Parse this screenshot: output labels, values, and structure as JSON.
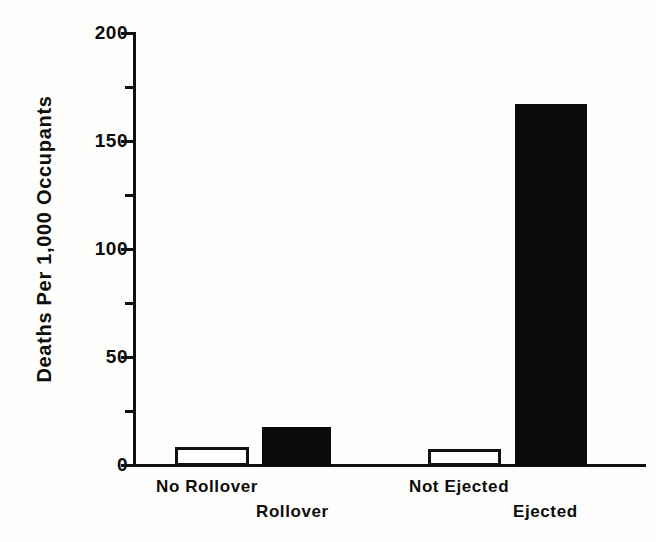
{
  "chart_data": {
    "type": "bar",
    "title": "",
    "xlabel": "",
    "ylabel": "Deaths Per 1,000 Occupants",
    "ylim": [
      0,
      200
    ],
    "grid": false,
    "legend": "none",
    "y_ticks_major": [
      "0",
      "50",
      "100",
      "150",
      "200"
    ],
    "y_tick_values_major": [
      0,
      50,
      100,
      150,
      200
    ],
    "y_tick_values_minor": [
      25,
      75,
      125,
      175
    ],
    "categories": [
      "No Rollover",
      "Rollover",
      "Not Ejected",
      "Ejected"
    ],
    "values": [
      9,
      18,
      8,
      167
    ],
    "bar_styles": [
      "open",
      "filled",
      "open",
      "filled"
    ],
    "groups": [
      {
        "name": "Rollover status",
        "bars": [
          {
            "label": "No Rollover",
            "value": 9,
            "style": "open"
          },
          {
            "label": "Rollover",
            "value": 18,
            "style": "filled"
          }
        ]
      },
      {
        "name": "Ejection status",
        "bars": [
          {
            "label": "Not Ejected",
            "value": 8,
            "style": "open"
          },
          {
            "label": "Ejected",
            "value": 167,
            "style": "filled"
          }
        ]
      }
    ],
    "colors": {
      "open_bar_fill": "#ffffff",
      "open_bar_edge": "#111111",
      "filled_bar": "#0a0a0a",
      "axis": "#111111",
      "text": "#0d0d0d",
      "background": "#fdfdfc"
    }
  },
  "axis": {
    "y_title": "Deaths Per 1,000 Occupants",
    "ticks": [
      {
        "label": "200"
      },
      {
        "label": "150"
      },
      {
        "label": "100"
      },
      {
        "label": "50"
      },
      {
        "label": "0"
      }
    ]
  },
  "x_labels": [
    {
      "text": "No Rollover"
    },
    {
      "text": "Rollover"
    },
    {
      "text": "Not Ejected"
    },
    {
      "text": "Ejected"
    }
  ]
}
